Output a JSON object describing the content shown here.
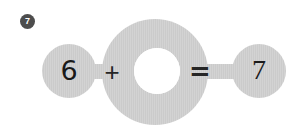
{
  "exercise": {
    "number_badge": "7"
  },
  "equation": {
    "left_operand": "6",
    "operator": "+",
    "missing_operand": "",
    "equals_sign": "=",
    "result": "7"
  },
  "colors": {
    "figure_fill": "#c9c9c9",
    "figure_fill_light": "#d4d4d4",
    "blank_fill": "#ffffff",
    "glyph": "#1a1a1a",
    "badge_fill": "#4d4d4d",
    "badge_text": "#ffffff",
    "page_background": "#ffffff"
  },
  "layout": {
    "left_circle": {
      "cx": 69,
      "cy": 71,
      "r": 27
    },
    "center_circle": {
      "cx": 155,
      "cy": 72,
      "r": 53
    },
    "blank_circle": {
      "cx": 157,
      "cy": 71,
      "r": 23
    },
    "right_circle": {
      "cx": 259,
      "cy": 71,
      "r": 27
    },
    "connector_height": 15
  }
}
